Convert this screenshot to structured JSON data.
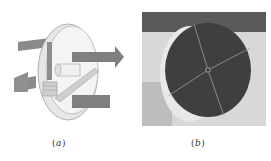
{
  "figure": {
    "panels": [
      {
        "id": "a",
        "caption_open": "(",
        "caption_letter": "a",
        "caption_close": ")",
        "description": "rotary wheel schematic with airflow arrows"
      },
      {
        "id": "b",
        "caption_open": "(",
        "caption_letter": "b",
        "caption_close": ")",
        "description": "photo of rotary desiccant wheel"
      }
    ],
    "colors": {
      "wheel_face": "#3f3f3f",
      "wheel_rim": "#d9d9d9",
      "arrow": "#8a8a8a"
    }
  }
}
